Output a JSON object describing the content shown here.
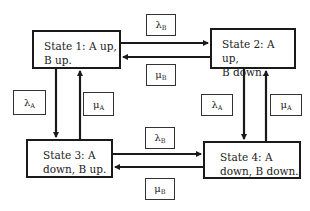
{
  "diagram": {
    "type": "markov-state-transition",
    "states": [
      {
        "id": "state1",
        "line1": "State 1: A up,",
        "line2": "B up."
      },
      {
        "id": "state2",
        "line1": "State 2: A up,",
        "line2": "B down."
      },
      {
        "id": "state3",
        "line1": "State 3: A",
        "line2": "down, B up."
      },
      {
        "id": "state4",
        "line1": "State 4: A",
        "line2": "down, B down."
      }
    ],
    "rates": {
      "top_lambda": {
        "symbol": "λ",
        "sub": "B"
      },
      "top_mu": {
        "symbol": "μ",
        "sub": "B"
      },
      "left_lambda": {
        "symbol": "λ",
        "sub": "A"
      },
      "left_mu": {
        "symbol": "μ",
        "sub": "A"
      },
      "right_lambda": {
        "symbol": "λ",
        "sub": "A"
      },
      "right_mu": {
        "symbol": "μ",
        "sub": "A"
      },
      "bottom_lambda": {
        "symbol": "λ",
        "sub": "B"
      },
      "bottom_mu": {
        "symbol": "μ",
        "sub": "B"
      }
    },
    "transitions": [
      {
        "from": "state1",
        "to": "state2",
        "rate": "λB"
      },
      {
        "from": "state2",
        "to": "state1",
        "rate": "μB"
      },
      {
        "from": "state1",
        "to": "state3",
        "rate": "λA"
      },
      {
        "from": "state3",
        "to": "state1",
        "rate": "μA"
      },
      {
        "from": "state2",
        "to": "state4",
        "rate": "λA"
      },
      {
        "from": "state4",
        "to": "state2",
        "rate": "μA"
      },
      {
        "from": "state3",
        "to": "state4",
        "rate": "λB"
      },
      {
        "from": "state4",
        "to": "state3",
        "rate": "μB"
      }
    ]
  }
}
